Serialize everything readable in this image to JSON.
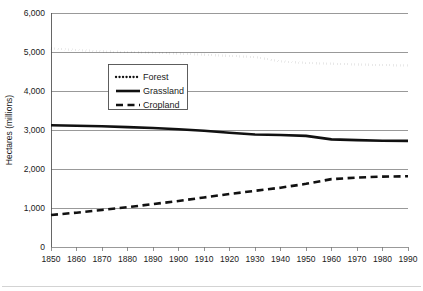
{
  "chart_data": {
    "type": "line",
    "title": "",
    "xlabel": "",
    "ylabel": "Hectares (millions)",
    "xlim": [
      1850,
      1990
    ],
    "ylim": [
      0,
      6000
    ],
    "grid": true,
    "legend_position": "upper-left-inside",
    "x": [
      1850,
      1860,
      1870,
      1880,
      1890,
      1900,
      1910,
      1920,
      1930,
      1940,
      1950,
      1960,
      1970,
      1980,
      1990
    ],
    "xtick_labels": [
      "1850",
      "1860",
      "1870",
      "1880",
      "1890",
      "1900",
      "1910",
      "1920",
      "1930",
      "1940",
      "1950",
      "1960",
      "1970",
      "1980",
      "1990"
    ],
    "ytick_values": [
      0,
      1000,
      2000,
      3000,
      4000,
      5000,
      6000
    ],
    "ytick_labels": [
      "0",
      "1,000",
      "2,000",
      "3,000",
      "4,000",
      "5,000",
      "6,000"
    ],
    "series": [
      {
        "name": "Forest",
        "style": "dotted",
        "color": "#111111",
        "values": [
          5090,
          5050,
          5020,
          5000,
          4985,
          4960,
          4930,
          4900,
          4870,
          4760,
          4720,
          4700,
          4680,
          4665,
          4655
        ]
      },
      {
        "name": "Grassland",
        "style": "solid",
        "color": "#111111",
        "values": [
          3120,
          3110,
          3095,
          3075,
          3050,
          3020,
          2980,
          2930,
          2885,
          2870,
          2850,
          2760,
          2740,
          2725,
          2720
        ]
      },
      {
        "name": "Cropland",
        "style": "dashed",
        "color": "#111111",
        "values": [
          820,
          880,
          950,
          1020,
          1100,
          1180,
          1270,
          1360,
          1440,
          1520,
          1620,
          1740,
          1780,
          1805,
          1815
        ]
      }
    ]
  },
  "legend": {
    "items": [
      {
        "label": "Forest",
        "style": "dotted"
      },
      {
        "label": "Grassland",
        "style": "solid"
      },
      {
        "label": "Cropland",
        "style": "dashed"
      }
    ]
  }
}
